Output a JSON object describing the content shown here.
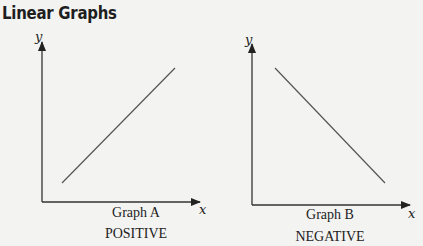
{
  "title": "Linear Graphs",
  "colors": {
    "axis": "#333333",
    "line": "#555555",
    "background": "#f3f3f1"
  },
  "graphs": [
    {
      "name": "Graph A",
      "label": "POSITIVE",
      "x_axis_label": "x",
      "y_axis_label": "y",
      "slope": "positive"
    },
    {
      "name": "Graph B",
      "label": "NEGATIVE",
      "x_axis_label": "x",
      "y_axis_label": "y",
      "slope": "negative"
    }
  ]
}
